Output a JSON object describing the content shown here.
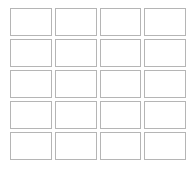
{
  "page": {
    "background_color": "#ffffff",
    "width": 195,
    "height": 173
  },
  "grid": {
    "name": "blank-cell-grid",
    "columns": 4,
    "rows": 5,
    "cell_count": 20,
    "cell_border_color": "#b5b5b5",
    "cell_fill_color": "#ffffff",
    "cell_border_width_px": 1,
    "gap_px": 3,
    "cells": [
      {
        "row": 1,
        "col": 1,
        "label": ""
      },
      {
        "row": 1,
        "col": 2,
        "label": ""
      },
      {
        "row": 1,
        "col": 3,
        "label": ""
      },
      {
        "row": 1,
        "col": 4,
        "label": ""
      },
      {
        "row": 2,
        "col": 1,
        "label": ""
      },
      {
        "row": 2,
        "col": 2,
        "label": ""
      },
      {
        "row": 2,
        "col": 3,
        "label": ""
      },
      {
        "row": 2,
        "col": 4,
        "label": ""
      },
      {
        "row": 3,
        "col": 1,
        "label": ""
      },
      {
        "row": 3,
        "col": 2,
        "label": ""
      },
      {
        "row": 3,
        "col": 3,
        "label": ""
      },
      {
        "row": 3,
        "col": 4,
        "label": ""
      },
      {
        "row": 4,
        "col": 1,
        "label": ""
      },
      {
        "row": 4,
        "col": 2,
        "label": ""
      },
      {
        "row": 4,
        "col": 3,
        "label": ""
      },
      {
        "row": 4,
        "col": 4,
        "label": ""
      },
      {
        "row": 5,
        "col": 1,
        "label": ""
      },
      {
        "row": 5,
        "col": 2,
        "label": ""
      },
      {
        "row": 5,
        "col": 3,
        "label": ""
      },
      {
        "row": 5,
        "col": 4,
        "label": ""
      }
    ]
  }
}
